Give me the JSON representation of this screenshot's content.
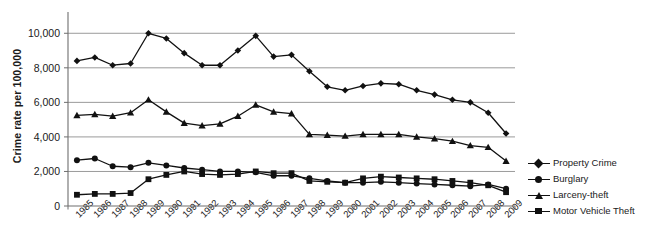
{
  "chart_data": {
    "type": "line",
    "title": "Figure 1. Property crime rates per 100,000",
    "xlabel": "",
    "ylabel": "Crime rate per 100,000",
    "ylim": [
      0,
      11000
    ],
    "yticks": [
      "0",
      "2,000",
      "4,000",
      "6,000",
      "8,000",
      "10,000"
    ],
    "ytick_values": [
      0,
      2000,
      4000,
      6000,
      8000,
      10000
    ],
    "grid": true,
    "legend_position": "right",
    "categories": [
      "1985",
      "1986",
      "1987",
      "1988",
      "1989",
      "1990",
      "1991",
      "1992",
      "1993",
      "1994",
      "1995",
      "1996",
      "1997",
      "1998",
      "1999",
      "2000",
      "2001",
      "2002",
      "2003",
      "2004",
      "2005",
      "2006",
      "2007",
      "2008",
      "2009"
    ],
    "series": [
      {
        "name": "Property Crime",
        "marker": "diamond",
        "values": [
          8400,
          8600,
          8150,
          8250,
          10000,
          9700,
          8850,
          8150,
          8150,
          9000,
          9850,
          8650,
          8750,
          7800,
          6900,
          6700,
          6950,
          7100,
          7050,
          6700,
          6450,
          6150,
          6000,
          5400,
          4200
        ]
      },
      {
        "name": "Burglary",
        "marker": "circle",
        "values": [
          2650,
          2750,
          2300,
          2250,
          2500,
          2350,
          2200,
          2100,
          2000,
          2000,
          1950,
          1750,
          1750,
          1600,
          1450,
          1350,
          1350,
          1400,
          1350,
          1300,
          1250,
          1200,
          1150,
          1250,
          1000
        ]
      },
      {
        "name": "Larceny-theft",
        "marker": "triangle",
        "values": [
          5250,
          5300,
          5200,
          5400,
          6150,
          5450,
          4800,
          4650,
          4750,
          5200,
          5850,
          5450,
          5350,
          4150,
          4100,
          4050,
          4150,
          4150,
          4150,
          4000,
          3900,
          3750,
          3500,
          3400,
          2600
        ]
      },
      {
        "name": "Motor Vehicle Theft",
        "marker": "square",
        "values": [
          650,
          700,
          700,
          750,
          1550,
          1800,
          2000,
          1850,
          1800,
          1850,
          2000,
          1900,
          1900,
          1450,
          1400,
          1350,
          1600,
          1700,
          1650,
          1600,
          1550,
          1450,
          1350,
          1200,
          800
        ]
      }
    ]
  },
  "legend": {
    "items": [
      {
        "label": "Property Crime",
        "marker": "diamond"
      },
      {
        "label": "Burglary",
        "marker": "circle"
      },
      {
        "label": "Larceny-theft",
        "marker": "triangle"
      },
      {
        "label": "Motor Vehicle Theft",
        "marker": "square"
      }
    ]
  },
  "colors": {
    "line": "#111111",
    "grid": "#9a9a9a",
    "axis": "#6e6e6e",
    "text": "#1a1a1a"
  }
}
